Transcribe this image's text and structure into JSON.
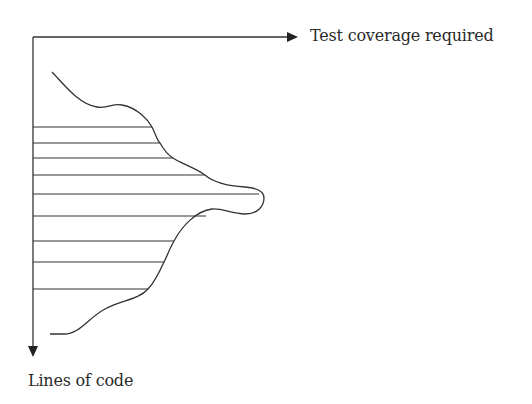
{
  "diagram": {
    "x_axis_label": "Test coverage required",
    "y_axis_label": "Lines of code",
    "colors": {
      "stroke": "#333333",
      "text": "#2a2a2a",
      "background": "#ffffff"
    },
    "hatch_lines": [
      {
        "y": 127,
        "x_end": 152
      },
      {
        "y": 143,
        "x_end": 160
      },
      {
        "y": 158,
        "x_end": 173
      },
      {
        "y": 175,
        "x_end": 205
      },
      {
        "y": 194,
        "x_end": 259
      },
      {
        "y": 216,
        "x_end": 206
      },
      {
        "y": 241,
        "x_end": 174
      },
      {
        "y": 262,
        "x_end": 164
      },
      {
        "y": 289,
        "x_end": 148
      }
    ]
  }
}
